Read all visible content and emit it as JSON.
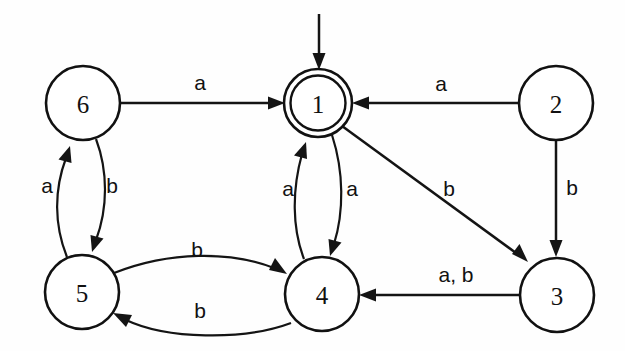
{
  "diagram": {
    "alphabet": [
      "a",
      "b"
    ],
    "start_state": "1",
    "accepting_states": [
      "1"
    ],
    "colors": {
      "stroke": "#141414",
      "node_fill": "#ffffff",
      "background": "#fefefe",
      "text": "#111111"
    },
    "states": [
      {
        "id": "s6",
        "label": "6",
        "cx": 83,
        "cy": 103,
        "r": 37,
        "accepting": false
      },
      {
        "id": "s1",
        "label": "1",
        "cx": 318,
        "cy": 103,
        "r": 33,
        "accepting": true
      },
      {
        "id": "s2",
        "label": "2",
        "cx": 556,
        "cy": 103,
        "r": 37,
        "accepting": false
      },
      {
        "id": "s5",
        "label": "5",
        "cx": 82,
        "cy": 292,
        "r": 37,
        "accepting": false
      },
      {
        "id": "s4",
        "label": "4",
        "cx": 322,
        "cy": 294,
        "r": 37,
        "accepting": false
      },
      {
        "id": "s3",
        "label": "3",
        "cx": 557,
        "cy": 295,
        "r": 37,
        "accepting": false
      }
    ],
    "transitions": [
      {
        "id": "t6_1",
        "from": "6",
        "to": "1",
        "label": "a",
        "label_x": 200,
        "label_y": 82
      },
      {
        "id": "t2_1",
        "from": "2",
        "to": "1",
        "label": "a",
        "label_x": 441,
        "label_y": 83
      },
      {
        "id": "t5_6",
        "from": "5",
        "to": "6",
        "label": "a",
        "label_x": 47,
        "label_y": 185
      },
      {
        "id": "t6_5",
        "from": "6",
        "to": "5",
        "label": "b",
        "label_x": 112,
        "label_y": 185
      },
      {
        "id": "t4_1",
        "from": "4",
        "to": "1",
        "label": "a",
        "label_x": 288,
        "label_y": 188
      },
      {
        "id": "t1_4",
        "from": "1",
        "to": "4",
        "label": "a",
        "label_x": 352,
        "label_y": 188
      },
      {
        "id": "t1_3",
        "from": "1",
        "to": "3",
        "label": "b",
        "label_x": 449,
        "label_y": 188
      },
      {
        "id": "t2_3",
        "from": "2",
        "to": "3",
        "label": "b",
        "label_x": 572,
        "label_y": 187
      },
      {
        "id": "t5_4",
        "from": "5",
        "to": "4",
        "label": "b",
        "label_x": 197,
        "label_y": 249
      },
      {
        "id": "t4_5",
        "from": "4",
        "to": "5",
        "label": "b",
        "label_x": 200,
        "label_y": 310
      },
      {
        "id": "t3_4",
        "from": "3",
        "to": "4",
        "label": "a, b",
        "label_x": 456,
        "label_y": 274
      }
    ],
    "start_marker": {
      "x": 319,
      "y_from": 14,
      "y_to": 68
    }
  }
}
